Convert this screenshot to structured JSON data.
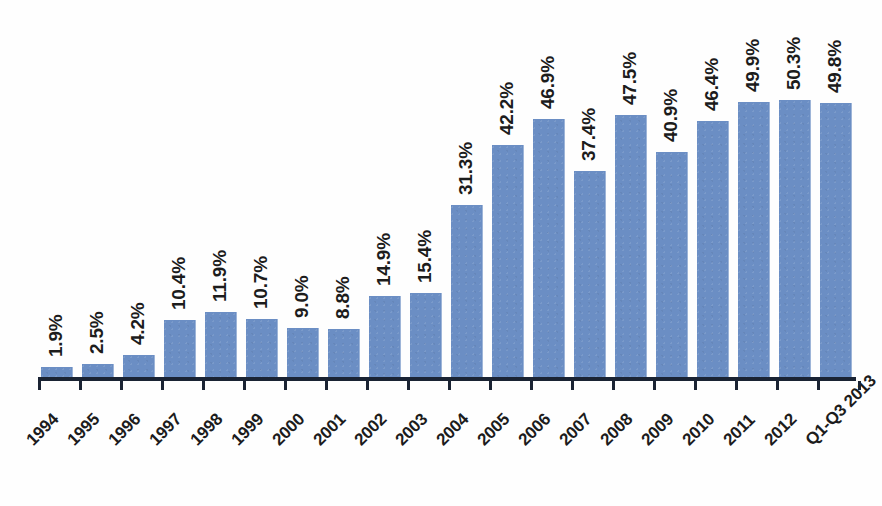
{
  "chart_data": {
    "type": "bar",
    "title": "",
    "subtitle": "",
    "xlabel": "",
    "ylabel": "",
    "legend": [],
    "grid": false,
    "ylim": [
      0,
      52
    ],
    "value_suffix": "%",
    "categories": [
      "1994",
      "1995",
      "1996",
      "1997",
      "1998",
      "1999",
      "2000",
      "2001",
      "2002",
      "2003",
      "2004",
      "2005",
      "2006",
      "2007",
      "2008",
      "2009",
      "2010",
      "2011",
      "2012",
      "Q1-Q3 2013"
    ],
    "values": [
      1.9,
      2.5,
      4.2,
      10.4,
      11.9,
      10.7,
      9.0,
      8.8,
      14.9,
      15.4,
      31.3,
      42.2,
      46.9,
      37.4,
      47.5,
      40.9,
      46.4,
      49.9,
      50.3,
      49.8
    ],
    "value_labels": [
      "1.9%",
      "2.5%",
      "4.2%",
      "10.4%",
      "11.9%",
      "10.7%",
      "9.0%",
      "8.8%",
      "14.9%",
      "15.4%",
      "31.3%",
      "42.2%",
      "46.9%",
      "37.4%",
      "47.5%",
      "40.9%",
      "46.4%",
      "49.9%",
      "50.3%",
      "49.8%"
    ],
    "series": [
      {
        "name": "",
        "values": [
          1.9,
          2.5,
          4.2,
          10.4,
          11.9,
          10.7,
          9.0,
          8.8,
          14.9,
          15.4,
          31.3,
          42.2,
          46.9,
          37.4,
          47.5,
          40.9,
          46.4,
          49.9,
          50.3,
          49.8
        ]
      }
    ]
  },
  "colors": {
    "bar": "#6b8ec4",
    "axis": "#1a2333",
    "label_text": "#1c1c1c",
    "background": "#ffffff"
  }
}
